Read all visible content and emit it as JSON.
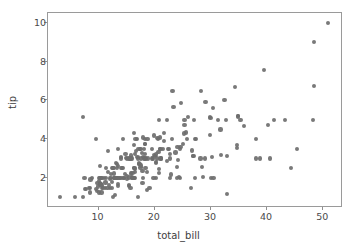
{
  "chart_data": {
    "type": "scatter",
    "title": "",
    "xlabel": "total_bill",
    "ylabel": "tip",
    "xlim": [
      1.0,
      53.5
    ],
    "ylim": [
      0.45,
      10.5
    ],
    "xticks": [
      10,
      20,
      30,
      40,
      50
    ],
    "yticks": [
      2,
      4,
      6,
      8,
      10
    ],
    "xticklabels": [
      "10",
      "20",
      "30",
      "40",
      "50"
    ],
    "yticklabels": [
      "2",
      "4",
      "6",
      "8",
      "10"
    ],
    "grid": false,
    "legend": null,
    "marker_color": "#6e6e6e",
    "marker_size": 4.2,
    "background_color": "#ffffff",
    "spine_color": "#9a9a9a",
    "n_points": 244,
    "series": [
      {
        "name": "tips",
        "x": [
          16.99,
          10.34,
          21.01,
          23.68,
          24.59,
          25.29,
          8.77,
          26.88,
          15.04,
          14.78,
          10.27,
          35.26,
          15.42,
          18.43,
          14.83,
          21.58,
          10.33,
          16.29,
          16.97,
          20.65,
          17.92,
          20.29,
          15.77,
          39.42,
          19.82,
          17.81,
          13.37,
          12.69,
          21.7,
          19.65,
          9.55,
          18.35,
          15.06,
          20.69,
          17.78,
          24.06,
          16.31,
          16.93,
          18.69,
          31.27,
          16.04,
          17.46,
          13.94,
          9.68,
          30.4,
          18.29,
          22.23,
          32.4,
          28.55,
          18.04,
          12.54,
          10.29,
          34.81,
          9.94,
          25.56,
          19.49,
          38.01,
          26.41,
          11.24,
          48.27,
          20.29,
          13.81,
          11.02,
          18.29,
          17.59,
          20.08,
          16.45,
          3.07,
          20.23,
          15.01,
          12.02,
          17.07,
          26.86,
          25.28,
          14.73,
          10.51,
          17.92,
          27.2,
          22.76,
          17.29,
          19.44,
          16.66,
          10.07,
          32.68,
          15.98,
          34.83,
          13.03,
          18.28,
          24.71,
          21.16,
          28.97,
          22.49,
          5.75,
          16.32,
          22.75,
          40.17,
          27.28,
          12.03,
          21.01,
          12.46,
          11.35,
          15.38,
          44.3,
          22.42,
          20.92,
          15.36,
          20.49,
          25.21,
          18.24,
          14.31,
          14.0,
          7.25,
          38.07,
          23.95,
          25.71,
          17.31,
          29.93,
          10.65,
          12.43,
          24.08,
          11.69,
          13.42,
          14.26,
          15.95,
          12.48,
          29.8,
          8.52,
          14.52,
          11.38,
          22.82,
          19.08,
          20.27,
          11.17,
          12.26,
          18.26,
          8.51,
          10.33,
          14.15,
          16.0,
          13.16,
          17.47,
          34.3,
          41.19,
          27.05,
          16.43,
          8.35,
          18.64,
          11.87,
          9.78,
          7.51,
          14.07,
          13.13,
          17.26,
          24.55,
          19.77,
          29.85,
          48.17,
          25.0,
          13.39,
          16.49,
          21.5,
          12.66,
          16.21,
          13.81,
          17.51,
          24.52,
          20.76,
          31.71,
          10.59,
          10.63,
          50.81,
          15.81,
          7.25,
          31.85,
          16.82,
          32.9,
          17.89,
          14.48,
          9.6,
          34.63,
          34.65,
          23.33,
          45.35,
          23.17,
          40.55,
          20.69,
          20.9,
          30.46,
          18.15,
          23.1,
          15.69,
          19.81,
          28.44,
          15.48,
          16.58,
          7.56,
          10.34,
          43.11,
          13.0,
          13.51,
          18.71,
          12.74,
          13.0,
          16.4,
          20.53,
          16.47,
          26.59,
          38.73,
          24.27,
          12.76,
          30.06,
          25.89,
          48.33,
          13.27,
          28.17,
          12.9,
          28.15,
          11.59,
          7.74,
          30.14,
          12.16,
          13.42,
          8.58,
          15.98,
          13.42,
          16.27,
          10.09,
          20.45,
          13.28,
          22.12,
          24.01,
          15.69,
          11.61,
          10.77,
          15.53,
          10.07,
          12.6,
          32.83,
          35.83,
          29.03,
          27.18,
          22.67,
          17.82,
          18.78
        ],
        "y": [
          1.01,
          1.66,
          3.5,
          3.31,
          3.61,
          4.71,
          2.0,
          3.12,
          1.96,
          3.23,
          1.71,
          5.0,
          1.57,
          3.0,
          3.02,
          3.92,
          1.67,
          3.71,
          3.5,
          3.35,
          4.08,
          2.75,
          2.23,
          7.58,
          3.18,
          2.34,
          2.0,
          2.0,
          4.3,
          3.0,
          1.45,
          2.5,
          3.0,
          2.45,
          3.27,
          3.6,
          2.0,
          3.07,
          2.31,
          5.0,
          2.24,
          2.54,
          3.06,
          1.32,
          5.6,
          3.0,
          5.0,
          6.0,
          2.05,
          3.0,
          2.5,
          2.6,
          5.2,
          1.56,
          4.34,
          3.51,
          3.0,
          1.5,
          1.76,
          6.73,
          3.21,
          2.0,
          1.98,
          3.76,
          2.64,
          3.15,
          2.47,
          1.0,
          2.01,
          2.09,
          1.97,
          3.0,
          3.14,
          5.0,
          2.2,
          1.25,
          3.08,
          4.0,
          3.0,
          2.71,
          3.0,
          3.4,
          1.83,
          5.0,
          2.03,
          5.17,
          2.0,
          4.0,
          5.85,
          3.0,
          3.0,
          3.5,
          1.0,
          4.3,
          3.25,
          4.73,
          4.0,
          1.5,
          3.0,
          1.5,
          2.5,
          3.0,
          2.5,
          3.48,
          4.08,
          1.64,
          4.06,
          4.29,
          3.76,
          4.0,
          3.0,
          1.0,
          4.0,
          2.55,
          4.0,
          3.5,
          5.07,
          1.5,
          1.8,
          2.92,
          2.31,
          1.68,
          2.5,
          2.0,
          2.52,
          4.2,
          1.48,
          2.0,
          2.0,
          2.18,
          1.5,
          2.83,
          1.5,
          2.0,
          3.25,
          1.25,
          2.0,
          2.0,
          2.0,
          2.75,
          3.5,
          6.7,
          5.0,
          5.0,
          2.3,
          1.5,
          1.36,
          1.63,
          1.73,
          2.0,
          2.5,
          2.0,
          2.74,
          2.0,
          2.0,
          5.14,
          5.0,
          3.75,
          2.61,
          2.0,
          3.5,
          2.5,
          2.0,
          2.0,
          3.0,
          3.48,
          2.24,
          4.5,
          1.61,
          2.0,
          10.0,
          3.16,
          5.15,
          3.18,
          4.0,
          3.11,
          2.0,
          2.0,
          4.0,
          3.55,
          3.68,
          5.65,
          3.5,
          6.5,
          3.0,
          5.0,
          3.5,
          2.0,
          3.5,
          4.0,
          1.5,
          4.19,
          2.56,
          2.02,
          4.0,
          1.44,
          2.0,
          5.0,
          2.0,
          2.0,
          4.0,
          2.0,
          2.0,
          2.5,
          4.0,
          3.23,
          3.41,
          3.0,
          2.03,
          2.23,
          2.0,
          5.16,
          9.0,
          2.5,
          6.5,
          1.1,
          3.0,
          1.5,
          1.44,
          3.09,
          2.2,
          3.48,
          1.92,
          3.0,
          1.58,
          2.5,
          2.0,
          3.0,
          2.72,
          2.88,
          2.0,
          3.0,
          3.39,
          1.47,
          3.0,
          1.25,
          1.0,
          1.17,
          4.67,
          5.92,
          2.0,
          2.0,
          1.75,
          3.0
        ]
      }
    ]
  },
  "axis": {
    "xlabel": "total_bill",
    "ylabel": "tip"
  }
}
